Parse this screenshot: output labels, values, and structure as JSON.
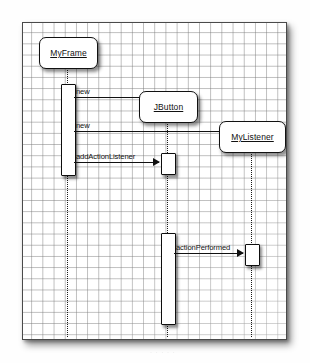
{
  "diagram": {
    "type": "uml-sequence-diagram",
    "background": "graph-paper-grid",
    "frame_color": "#4a4a4a",
    "ink_color": "#111111",
    "participants": [
      {
        "id": "myframe",
        "label": "MyFrame",
        "x": 16,
        "y": 14,
        "w": 57,
        "h": 30
      },
      {
        "id": "jbutton",
        "label": "JButton",
        "x": 116,
        "y": 68,
        "w": 57,
        "h": 30
      },
      {
        "id": "mylistener",
        "label": "MyListener",
        "x": 196,
        "y": 98,
        "w": 65,
        "h": 30
      }
    ],
    "lifelines": [
      {
        "id": "lifeline-myframe",
        "x": 44,
        "y": 44,
        "h": 270
      },
      {
        "id": "lifeline-jbutton",
        "x": 144,
        "y": 98,
        "h": 216
      },
      {
        "id": "lifeline-mylistener",
        "x": 228,
        "y": 128,
        "h": 186
      }
    ],
    "activations": [
      {
        "id": "activation-myframe-main",
        "x": 38,
        "y": 61,
        "w": 13,
        "h": 90
      },
      {
        "id": "activation-jbutton-add",
        "x": 138,
        "y": 130,
        "w": 13,
        "h": 20
      },
      {
        "id": "activation-jbutton-click",
        "x": 138,
        "y": 210,
        "w": 13,
        "h": 90
      },
      {
        "id": "activation-mylistener",
        "x": 222,
        "y": 221,
        "w": 13,
        "h": 20
      }
    ],
    "messages": [
      {
        "id": "msg-new-jbutton",
        "label": "new",
        "x": 51,
        "y": 74,
        "w": 85,
        "arrow": "solid-filled"
      },
      {
        "id": "msg-new-mylistener",
        "label": "new",
        "x": 51,
        "y": 108,
        "w": 169,
        "arrow": "solid-filled"
      },
      {
        "id": "msg-addactionlistener",
        "label": "addActionListener",
        "x": 51,
        "y": 139,
        "w": 85,
        "arrow": "solid-filled"
      },
      {
        "id": "msg-actionperformed",
        "label": "actionPerformed",
        "x": 151,
        "y": 230,
        "w": 69,
        "arrow": "solid-filled"
      }
    ],
    "caption_ghost": "· · · · ·"
  }
}
